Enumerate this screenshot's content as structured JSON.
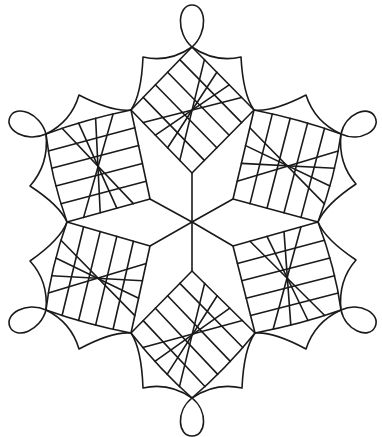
{
  "figure": {
    "stroke_color": "#1a1a1a",
    "background": "#ffffff",
    "center": [
      192,
      222
    ],
    "spokes": [
      [
        192,
        173
      ],
      [
        233,
        199
      ],
      [
        233,
        246
      ],
      [
        192,
        271
      ],
      [
        150,
        246
      ],
      [
        150,
        199
      ]
    ],
    "grid_divisions": 5,
    "squares": [
      {
        "name": "top",
        "inner": [
          192,
          173
        ],
        "a": [
          131,
          110
        ],
        "outer": [
          192,
          47
        ],
        "b": [
          254,
          110
        ],
        "bow": [
          0,
          0
        ]
      },
      {
        "name": "upper-right",
        "inner": [
          233,
          199
        ],
        "a": [
          254,
          110
        ],
        "outer": [
          341,
          134
        ],
        "b": [
          318,
          222
        ],
        "bow": [
          4,
          6
        ]
      },
      {
        "name": "lower-right",
        "inner": [
          233,
          246
        ],
        "a": [
          318,
          222
        ],
        "outer": [
          341,
          310
        ],
        "b": [
          255,
          333
        ],
        "bow": [
          6,
          4
        ]
      },
      {
        "name": "bottom",
        "inner": [
          192,
          271
        ],
        "a": [
          255,
          333
        ],
        "outer": [
          192,
          398
        ],
        "b": [
          131,
          333
        ],
        "bow": [
          5,
          5
        ]
      },
      {
        "name": "lower-left",
        "inner": [
          150,
          246
        ],
        "a": [
          131,
          333
        ],
        "outer": [
          46,
          310
        ],
        "b": [
          67,
          222
        ],
        "bow": [
          4,
          6
        ]
      },
      {
        "name": "upper-left",
        "inner": [
          150,
          199
        ],
        "a": [
          67,
          222
        ],
        "outer": [
          46,
          134
        ],
        "b": [
          131,
          110
        ],
        "bow": [
          6,
          4
        ]
      }
    ],
    "scallops": [
      {
        "from": [
          192,
          47
        ],
        "cusp": [
          143,
          57
        ],
        "to": [
          131,
          110
        ]
      },
      {
        "from": [
          192,
          47
        ],
        "cusp": [
          241,
          57
        ],
        "to": [
          254,
          110
        ]
      },
      {
        "from": [
          341,
          134
        ],
        "cusp": [
          306,
          95
        ],
        "to": [
          254,
          110
        ]
      },
      {
        "from": [
          341,
          134
        ],
        "cusp": [
          356,
          184
        ],
        "to": [
          318,
          222
        ]
      },
      {
        "from": [
          341,
          310
        ],
        "cusp": [
          356,
          260
        ],
        "to": [
          318,
          222
        ]
      },
      {
        "from": [
          341,
          310
        ],
        "cusp": [
          306,
          349
        ],
        "to": [
          255,
          333
        ]
      },
      {
        "from": [
          192,
          398
        ],
        "cusp": [
          242,
          388
        ],
        "to": [
          255,
          333
        ]
      },
      {
        "from": [
          192,
          398
        ],
        "cusp": [
          143,
          388
        ],
        "to": [
          131,
          333
        ]
      },
      {
        "from": [
          46,
          310
        ],
        "cusp": [
          79,
          349
        ],
        "to": [
          131,
          333
        ]
      },
      {
        "from": [
          46,
          310
        ],
        "cusp": [
          30,
          261
        ],
        "to": [
          67,
          222
        ]
      },
      {
        "from": [
          46,
          134
        ],
        "cusp": [
          30,
          186
        ],
        "to": [
          67,
          222
        ]
      },
      {
        "from": [
          46,
          134
        ],
        "cusp": [
          79,
          95
        ],
        "to": [
          131,
          110
        ]
      }
    ],
    "loops": [
      {
        "name": "top",
        "base": [
          192,
          47
        ],
        "tip": [
          192,
          5
        ],
        "width": 22
      },
      {
        "name": "upper-right",
        "base": [
          341,
          134
        ],
        "tip": [
          375,
          117
        ],
        "width": 22
      },
      {
        "name": "lower-right",
        "base": [
          341,
          310
        ],
        "tip": [
          375,
          327
        ],
        "width": 22
      },
      {
        "name": "bottom",
        "base": [
          192,
          398
        ],
        "tip": [
          192,
          436
        ],
        "width": 22
      },
      {
        "name": "lower-left",
        "base": [
          46,
          310
        ],
        "tip": [
          10,
          327
        ],
        "width": 22
      },
      {
        "name": "upper-left",
        "base": [
          46,
          134
        ],
        "tip": [
          10,
          117
        ],
        "width": 22
      }
    ]
  }
}
